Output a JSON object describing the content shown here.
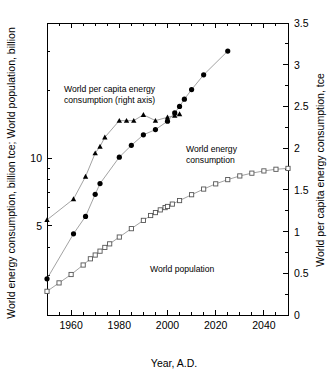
{
  "chart_data": {
    "type": "line",
    "title": "",
    "xlabel": "Year, A.D.",
    "ylabel_left": "World energy consumption, billion tce; World population, billion",
    "ylabel_right": "World per capita energy consumption, tce",
    "x_axis": {
      "min": 1950,
      "max": 2050,
      "major_ticks": [
        1960,
        1980,
        2000,
        2020,
        2040
      ],
      "major_tick_labels": [
        "1960",
        "1980",
        "2000",
        "2020",
        "2040"
      ],
      "minor_tick_step": 5,
      "scale": "linear"
    },
    "y_axis_left": {
      "scale": "log",
      "min": 2.0,
      "max": 40.0,
      "major_ticks": [
        5,
        10
      ],
      "major_tick_labels": [
        "5",
        "10"
      ],
      "minor_ticks": [
        2,
        3,
        4,
        6,
        7,
        8,
        9,
        20,
        30,
        40
      ]
    },
    "y_axis_right": {
      "scale": "linear",
      "min": 0,
      "max": 3.5,
      "major_ticks": [
        0,
        0.5,
        1,
        1.5,
        2,
        2.5,
        3,
        3.5
      ],
      "major_tick_labels": [
        "0",
        "0.5",
        "1",
        "1.5",
        "2",
        "2.5",
        "3",
        "3.5"
      ],
      "minor_tick_step": 0.25
    },
    "grid": false,
    "legend": "in-plot annotations",
    "annotations": [
      {
        "name": "per-capita-annotation",
        "lines": [
          "World per capita energy",
          "consumption (right axis)"
        ],
        "x": 64,
        "y": 92
      },
      {
        "name": "energy-consumption-annotation",
        "lines": [
          "World energy",
          "consumption"
        ],
        "x": 186,
        "y": 152
      },
      {
        "name": "population-annotation",
        "lines": [
          "World population"
        ],
        "x": 150,
        "y": 272
      }
    ],
    "series": [
      {
        "name": "World per capita energy consumption (right axis)",
        "axis": "right",
        "marker": "triangle",
        "marker_fill": "#000000",
        "x": [
          1950,
          1961,
          1966,
          1970,
          1972,
          1974,
          1980,
          1983,
          1986,
          1990,
          1995,
          2000,
          2003,
          2005
        ],
        "values": [
          1.14,
          1.39,
          1.66,
          1.94,
          2.02,
          2.13,
          2.33,
          2.33,
          2.33,
          2.4,
          2.33,
          2.37,
          2.39,
          2.41
        ]
      },
      {
        "name": "World energy consumption",
        "axis": "left",
        "marker": "circle",
        "marker_fill": "#000000",
        "x": [
          1950,
          1961,
          1966,
          1970,
          1972,
          1980,
          1985,
          1990,
          1995,
          2000,
          2003,
          2005,
          2007,
          2010,
          2015,
          2025
        ],
        "values": [
          2.9,
          4.6,
          5.5,
          6.9,
          7.7,
          10.1,
          11.4,
          12.7,
          13.4,
          14.6,
          15.9,
          17.0,
          18.3,
          20.2,
          23.5,
          30.0
        ]
      },
      {
        "name": "World population",
        "axis": "left",
        "marker": "square",
        "marker_fill": "#ffffff",
        "x": [
          1950,
          1955,
          1960,
          1965,
          1968,
          1970,
          1972,
          1974,
          1976,
          1980,
          1985,
          1990,
          1993,
          1995,
          1997,
          1999,
          2000,
          2002,
          2005,
          2010,
          2015,
          2020,
          2025,
          2030,
          2035,
          2040,
          2045,
          2050
        ],
        "values": [
          2.55,
          2.78,
          3.03,
          3.34,
          3.56,
          3.7,
          3.85,
          4.0,
          4.15,
          4.45,
          4.85,
          5.28,
          5.55,
          5.72,
          5.88,
          6.02,
          6.09,
          6.24,
          6.47,
          6.87,
          7.28,
          7.68,
          8.02,
          8.33,
          8.57,
          8.77,
          8.92,
          9.0
        ]
      }
    ]
  }
}
